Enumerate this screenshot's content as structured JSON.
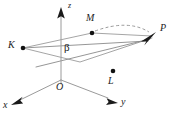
{
  "figure": {
    "type": "geometry-diagram",
    "background_color": "#ffffff",
    "line_color": "#9a9a9a",
    "marker_color": "#121212",
    "text_color": "#1b1b1b",
    "width": 174,
    "height": 117
  },
  "axes": [
    {
      "name": "z",
      "label": "z",
      "label_x": 70,
      "label_y": 3,
      "from": {
        "x": 61,
        "y": 80
      },
      "to": {
        "x": 61,
        "y": 12
      },
      "arrow": true
    },
    {
      "name": "x",
      "label": "x",
      "label_x": 3,
      "label_y": 100,
      "from": {
        "x": 61,
        "y": 80
      },
      "to": {
        "x": 14,
        "y": 103
      },
      "arrow": true
    },
    {
      "name": "y",
      "label": "y",
      "label_x": 122,
      "label_y": 97,
      "from": {
        "x": 61,
        "y": 80
      },
      "to": {
        "x": 114,
        "y": 101
      },
      "arrow": true
    }
  ],
  "points": [
    {
      "name": "K",
      "label": "K",
      "dot_x": 23,
      "dot_y": 48,
      "label_x": 8,
      "label_y": 41,
      "has_dot": true
    },
    {
      "name": "M",
      "label": "M",
      "dot_x": 92,
      "dot_y": 33,
      "label_x": 87,
      "label_y": 15,
      "has_dot": true
    },
    {
      "name": "L",
      "label": "L",
      "dot_x": 113,
      "dot_y": 71,
      "label_x": 108,
      "label_y": 77,
      "has_dot": true
    },
    {
      "name": "P",
      "label": "P",
      "dot_x": 154,
      "dot_y": 35,
      "label_x": 160,
      "label_y": 24,
      "has_dot": false
    },
    {
      "name": "O",
      "label": "O",
      "dot_x": 61,
      "dot_y": 80,
      "label_x": 57,
      "label_y": 84,
      "has_dot": false
    }
  ],
  "angle": {
    "name": "beta",
    "label": "β",
    "label_x": 64,
    "label_y": 43
  },
  "plane_region": {
    "name": "beta-plane",
    "vertices": [
      {
        "x": 23,
        "y": 48
      },
      {
        "x": 92,
        "y": 33
      },
      {
        "x": 152,
        "y": 37
      },
      {
        "x": 80,
        "y": 62
      }
    ]
  },
  "segments": [
    {
      "name": "K-to-M-edge",
      "x1": 23,
      "y1": 48,
      "x2": 152,
      "y2": 37,
      "style": "solid"
    },
    {
      "name": "K-to-lower-edge",
      "x1": 23,
      "y1": 48,
      "x2": 152,
      "y2": 39,
      "style": "solid"
    },
    {
      "name": "lower-plane-edge",
      "x1": 36,
      "y1": 66,
      "x2": 152,
      "y2": 38,
      "style": "solid"
    },
    {
      "name": "plane-left-edge",
      "x1": 23,
      "y1": 48,
      "x2": 80,
      "y2": 62,
      "style": "solid"
    }
  ],
  "dashed_curve": {
    "name": "M-to-P-arc",
    "from": {
      "x": 93,
      "y": 31
    },
    "control": {
      "x": 128,
      "y": 20
    },
    "to": {
      "x": 151,
      "y": 34
    }
  }
}
